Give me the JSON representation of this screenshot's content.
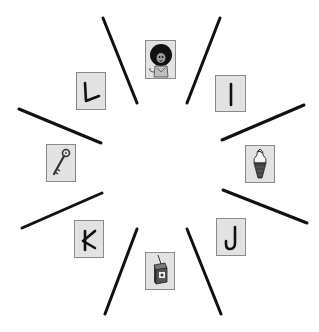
{
  "canvas": {
    "width": 319,
    "height": 332,
    "background": "#ffffff"
  },
  "style": {
    "line_color": "#111111",
    "card_fill": "#e2e2e2",
    "card_border": "#8a8a8a",
    "glyph_color": "#111111"
  },
  "dividers": [
    {
      "id": "divider-1",
      "x1": 103,
      "y1": 18,
      "x2": 137,
      "y2": 103
    },
    {
      "id": "divider-2",
      "x1": 220,
      "y1": 18,
      "x2": 187,
      "y2": 103
    },
    {
      "id": "divider-3",
      "x1": 304,
      "y1": 105,
      "x2": 222,
      "y2": 140
    },
    {
      "id": "divider-4",
      "x1": 223,
      "y1": 190,
      "x2": 307,
      "y2": 223
    },
    {
      "id": "divider-5",
      "x1": 187,
      "y1": 229,
      "x2": 221,
      "y2": 314
    },
    {
      "id": "divider-6",
      "x1": 137,
      "y1": 229,
      "x2": 105,
      "y2": 314
    },
    {
      "id": "divider-7",
      "x1": 22,
      "y1": 228,
      "x2": 102,
      "y2": 193
    },
    {
      "id": "divider-8",
      "x1": 19,
      "y1": 109,
      "x2": 101,
      "y2": 143
    }
  ],
  "cards": [
    {
      "id": "card-lion",
      "kind": "picture",
      "icon": "lion-icon",
      "x": 145,
      "y": 40,
      "w": 31,
      "h": 39
    },
    {
      "id": "card-letter-i",
      "kind": "letter",
      "letter": "I",
      "x": 215,
      "y": 75,
      "w": 31,
      "h": 37
    },
    {
      "id": "card-ice-cream",
      "kind": "picture",
      "icon": "ice-cream-cone-icon",
      "x": 245,
      "y": 145,
      "w": 30,
      "h": 38
    },
    {
      "id": "card-letter-j",
      "kind": "letter",
      "letter": "J",
      "x": 216,
      "y": 218,
      "w": 30,
      "h": 38
    },
    {
      "id": "card-juice-box",
      "kind": "picture",
      "icon": "juice-box-icon",
      "x": 145,
      "y": 252,
      "w": 30,
      "h": 38
    },
    {
      "id": "card-letter-k",
      "kind": "letter",
      "letter": "K",
      "x": 74,
      "y": 220,
      "w": 30,
      "h": 38
    },
    {
      "id": "card-key",
      "kind": "picture",
      "icon": "key-icon",
      "x": 46,
      "y": 144,
      "w": 30,
      "h": 38
    },
    {
      "id": "card-letter-l",
      "kind": "letter",
      "letter": "L",
      "x": 76,
      "y": 72,
      "w": 30,
      "h": 38
    }
  ]
}
